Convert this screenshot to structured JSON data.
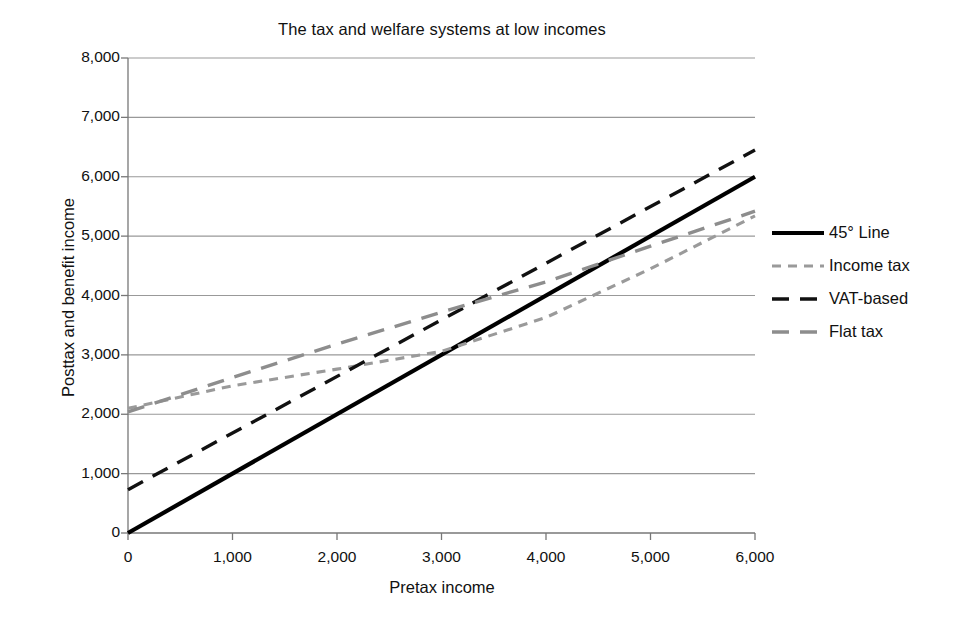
{
  "chart_data": {
    "type": "line",
    "title": "The tax and welfare systems at low incomes",
    "xlabel": "Pretax income",
    "ylabel": "Posttax and benefit income",
    "xlim": [
      0,
      6000
    ],
    "ylim": [
      0,
      8000
    ],
    "xticks": [
      "0",
      "1,000",
      "2,000",
      "3,000",
      "4,000",
      "5,000",
      "6,000"
    ],
    "xtick_values": [
      0,
      1000,
      2000,
      3000,
      4000,
      5000,
      6000
    ],
    "yticks": [
      "0",
      "1,000",
      "2,000",
      "3,000",
      "4,000",
      "5,000",
      "6,000",
      "7,000",
      "8,000"
    ],
    "ytick_values": [
      0,
      1000,
      2000,
      3000,
      4000,
      5000,
      6000,
      7000,
      8000
    ],
    "grid": "horizontal",
    "legend_position": "right",
    "series": [
      {
        "name": "45° Line",
        "style": "solid",
        "color": "#000000",
        "width": 4.2,
        "x": [
          0,
          6000
        ],
        "values": [
          0,
          6000
        ]
      },
      {
        "name": "Income tax",
        "style": "dotted",
        "color": "#9a9a9a",
        "width": 3.1,
        "x": [
          0,
          1000,
          2000,
          3000,
          4000,
          5000,
          6000
        ],
        "values": [
          2100,
          2480,
          2760,
          3060,
          3630,
          4450,
          5340
        ]
      },
      {
        "name": "VAT-based",
        "style": "dashed",
        "color": "#111111",
        "width": 3.4,
        "x": [
          0,
          6000
        ],
        "values": [
          730,
          6450
        ]
      },
      {
        "name": "Flat tax",
        "style": "dashed",
        "color": "#8d8d8d",
        "width": 3.4,
        "x": [
          0,
          1000,
          2000,
          3000,
          4000,
          5000,
          6000
        ],
        "values": [
          2040,
          2620,
          3180,
          3720,
          4230,
          4830,
          5420
        ]
      }
    ]
  },
  "legend": {
    "items": [
      {
        "label": "45° Line"
      },
      {
        "label": "Income tax"
      },
      {
        "label": "VAT-based"
      },
      {
        "label": "Flat tax"
      }
    ]
  }
}
